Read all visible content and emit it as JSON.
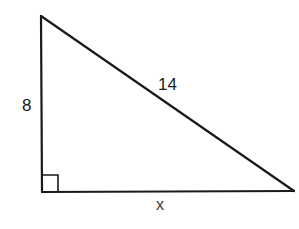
{
  "diagram": {
    "type": "right-triangle",
    "vertices": {
      "top": {
        "x": 41,
        "y": 16
      },
      "right_angle": {
        "x": 42,
        "y": 192
      },
      "right": {
        "x": 294,
        "y": 191
      }
    },
    "sides": {
      "vertical_leg": {
        "label": "8"
      },
      "hypotenuse": {
        "label": "14"
      },
      "horizontal_leg": {
        "label": "x"
      }
    },
    "right_angle_marker": {
      "size": 16
    },
    "stroke_color": "#1a1a1a",
    "background_color": "#ffffff"
  }
}
